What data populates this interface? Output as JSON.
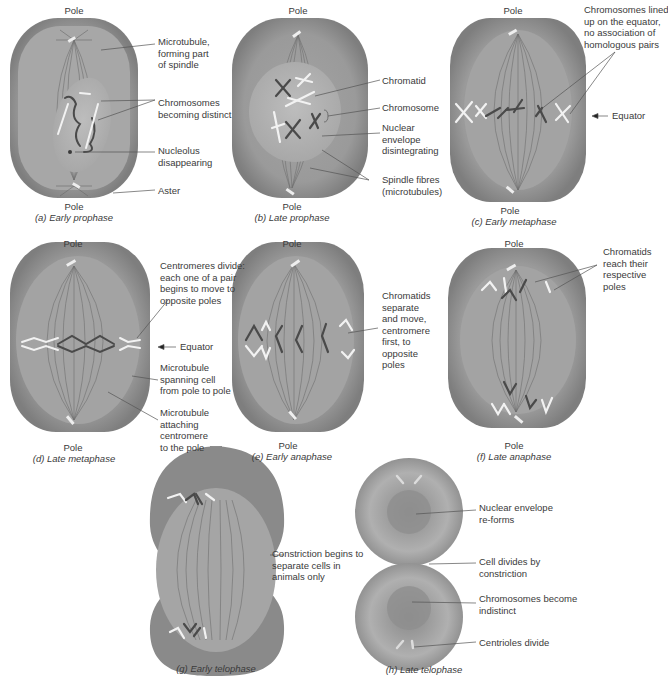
{
  "pole_label": "Pole",
  "equator_label": "Equator",
  "colors": {
    "cell_outer": "#8c8c8c",
    "cell_inner": "#a9a9a9",
    "spindle_region": "#9a9a9a",
    "nucleus": "#b4b4b4",
    "chromosome_dark": "#4a4a4a",
    "chromosome_light": "#f2f2f2",
    "leader_line": "#555555",
    "text": "#3a3a3a"
  },
  "panels": [
    {
      "id": "a",
      "caption": "(a) Early prophase",
      "labels": [
        "Microtubule, forming part of spindle",
        "Chromosomes becoming distinct",
        "Nucleolus disappearing",
        "Aster"
      ],
      "label_lines": [
        [
          "Microtubule,",
          "forming part",
          "of spindle"
        ],
        [
          "Chromosomes",
          "becoming distinct"
        ],
        [
          "Nucleolus",
          "disappearing"
        ],
        [
          "Aster"
        ]
      ]
    },
    {
      "id": "b",
      "caption": "(b) Late prophase",
      "label_lines": [
        [
          "Chromatid"
        ],
        [
          "Chromosome"
        ],
        [
          "Nuclear",
          "envelope",
          "disintegrating"
        ],
        [
          "Spindle fibres",
          "(microtubules)"
        ]
      ]
    },
    {
      "id": "c",
      "caption": "(c) Early metaphase",
      "label_lines": [
        [
          "Chromosomes lined",
          "up on the equator,",
          "no association of",
          "homologous pairs"
        ],
        [
          "Equator"
        ]
      ]
    },
    {
      "id": "d",
      "caption": "(d) Late metaphase",
      "label_lines": [
        [
          "Centromeres divide:",
          "each one of a pair",
          "begins to move to",
          "opposite poles"
        ],
        [
          "Equator"
        ],
        [
          "Microtubule",
          "spanning cell",
          "from pole to pole"
        ],
        [
          "Microtubule",
          "attaching",
          "centromere",
          "to the pole"
        ]
      ]
    },
    {
      "id": "e",
      "caption": "(e) Early anaphase",
      "label_lines": [
        [
          "Chromatids",
          "separate",
          "and move,",
          "centromere",
          "first, to",
          "opposite",
          "poles"
        ]
      ]
    },
    {
      "id": "f",
      "caption": "(f) Late anaphase",
      "label_lines": [
        [
          "Chromatids",
          "reach their",
          "respective",
          "poles"
        ]
      ]
    },
    {
      "id": "g",
      "caption": "(g) Early telophase",
      "label_lines": [
        [
          "Constriction begins to",
          "separate cells in",
          "animals only"
        ]
      ]
    },
    {
      "id": "h",
      "caption": "(h) Late telophase",
      "label_lines": [
        [
          "Nuclear envelope",
          "re-forms"
        ],
        [
          "Cell divides by",
          "constriction"
        ],
        [
          "Chromosomes become",
          "indistinct"
        ],
        [
          "Centrioles divide"
        ]
      ]
    }
  ]
}
